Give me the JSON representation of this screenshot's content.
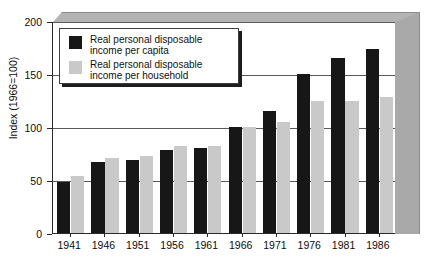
{
  "chart_data": {
    "type": "bar",
    "title": "",
    "subtitle": "",
    "xlabel": "",
    "ylabel": "Index (1966=100)",
    "ylim": [
      0,
      200
    ],
    "yticks": [
      0,
      50,
      100,
      150,
      200
    ],
    "grid": true,
    "grid_axis": "y",
    "legend_position": "upper-left-inside",
    "categories": [
      "1941",
      "1946",
      "1951",
      "1956",
      "1961",
      "1966",
      "1971",
      "1976",
      "1981",
      "1986"
    ],
    "series": [
      {
        "name": "Real personal disposable income per capita",
        "color": "#171717",
        "values": [
          48,
          67,
          69,
          78,
          80,
          100,
          115,
          150,
          165,
          174
        ]
      },
      {
        "name": "Real personal disposable income per household",
        "color": "#c9c9c9",
        "values": [
          54,
          71,
          73,
          82,
          82,
          100,
          105,
          125,
          125,
          128
        ]
      }
    ]
  },
  "axes": {
    "y_title": "Index (1966=100)",
    "y_tick_labels": [
      "0",
      "50",
      "100",
      "150",
      "200"
    ],
    "x_tick_labels": [
      "1941",
      "1946",
      "1951",
      "1956",
      "1961",
      "1966",
      "1971",
      "1976",
      "1981",
      "1986"
    ]
  },
  "legend": {
    "entries": [
      {
        "label": "Real personal disposable\nincome per capita",
        "color": "#171717",
        "swatch_name": "legend-swatch-per-capita"
      },
      {
        "label": "Real personal disposable\nincome per household",
        "color": "#c9c9c9",
        "swatch_name": "legend-swatch-per-household"
      }
    ]
  },
  "colors": {
    "series_dark": "#171717",
    "series_light": "#c9c9c9",
    "axis": "#2a2a2a",
    "gridline": "#5a5a5a",
    "frame_3d_top": "#b4b4b4",
    "frame_3d_right": "#a9a9a9",
    "plot_background": "#ffffff"
  }
}
